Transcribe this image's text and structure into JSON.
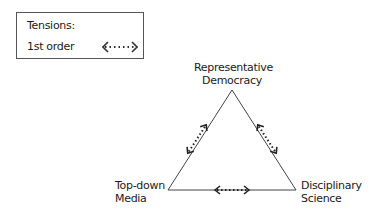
{
  "legend": {
    "title": "Tensions:",
    "items": [
      {
        "label": "1st order",
        "symbol": "dotted-double-arrow"
      }
    ]
  },
  "nodes": {
    "top": {
      "line1": "Representative",
      "line2": "Democracy"
    },
    "left": {
      "line1": "Top-down",
      "line2": "Media"
    },
    "right": {
      "line1": "Disciplinary",
      "line2": "Science"
    }
  },
  "edges": [
    {
      "from": "top",
      "to": "left",
      "tension": "1st order"
    },
    {
      "from": "top",
      "to": "right",
      "tension": "1st order"
    },
    {
      "from": "left",
      "to": "right",
      "tension": "1st order"
    }
  ],
  "colors": {
    "line": "#444444",
    "text": "#1a1a1a"
  }
}
